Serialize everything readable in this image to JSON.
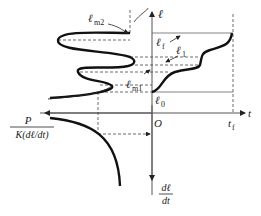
{
  "diagram": {
    "axes": {
      "vertical_up_label": "ℓ",
      "horizontal_right_label": "t",
      "vertical_down_label_num": "dℓ",
      "vertical_down_label_den": "dt",
      "origin_label": "O",
      "left_label_num": "P",
      "left_label_den": "K(dℓ/dt)"
    },
    "annotations": {
      "lm2": "ℓ",
      "lm2_sub": "m2",
      "lf": "ℓ",
      "lf_sub": "f",
      "l1": "ℓ",
      "l1_sub": "1",
      "lm1": "ℓ",
      "lm1_sub": "m1",
      "l0": "ℓ",
      "l0_sub": "0",
      "tf": "t",
      "tf_sub": "f"
    },
    "colors": {
      "curve": "#111111",
      "axis": "#555555",
      "dashed": "#444444"
    }
  }
}
